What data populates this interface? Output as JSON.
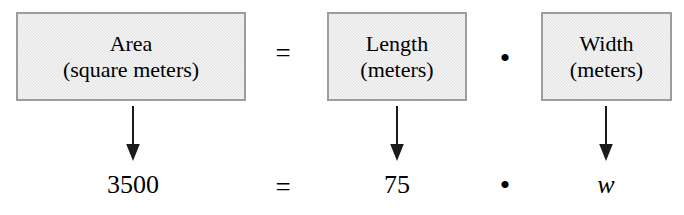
{
  "diagram": {
    "type": "verbal-model-equation",
    "boxes": [
      {
        "id": "area",
        "quantity": "Area",
        "units": "(square meters)"
      },
      {
        "id": "length",
        "quantity": "Length",
        "units": "(meters)"
      },
      {
        "id": "width",
        "quantity": "Width",
        "units": "(meters)"
      }
    ],
    "operators": {
      "equals": "=",
      "multiply": "•"
    },
    "arrows": {
      "glyph": "down-arrow",
      "count": 3
    },
    "substituted": {
      "area_value": "3500",
      "equals": "=",
      "length_value": "75",
      "multiply": "•",
      "width_value": "w"
    },
    "colors": {
      "box_fill": "#e3e3e3",
      "box_border": "#9d9d9d",
      "text": "#000000",
      "background": "#ffffff",
      "arrow": "#1a1a1a"
    }
  }
}
